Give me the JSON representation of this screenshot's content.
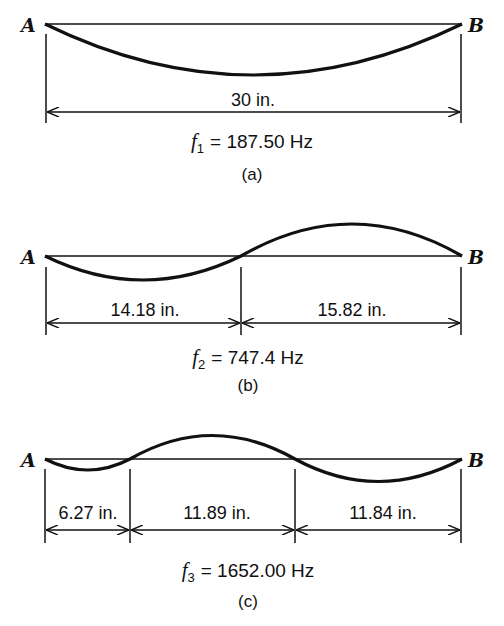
{
  "figure": {
    "panels": [
      {
        "id": "a",
        "caption": "(a)",
        "left_label": "A",
        "right_label": "B",
        "mode": 1,
        "frequency_symbol": "f",
        "frequency_subscript": "1",
        "frequency_value": "= 187.50 Hz",
        "segments": [
          {
            "label": "30 in."
          }
        ]
      },
      {
        "id": "b",
        "caption": "(b)",
        "left_label": "A",
        "right_label": "B",
        "mode": 2,
        "frequency_symbol": "f",
        "frequency_subscript": "2",
        "frequency_value": "= 747.4 Hz",
        "segments": [
          {
            "label": "14.18 in."
          },
          {
            "label": "15.82 in."
          }
        ]
      },
      {
        "id": "c",
        "caption": "(c)",
        "left_label": "A",
        "right_label": "B",
        "mode": 3,
        "frequency_symbol": "f",
        "frequency_subscript": "3",
        "frequency_value": "= 1652.00 Hz",
        "segments": [
          {
            "label": "6.27 in."
          },
          {
            "label": "11.89 in."
          },
          {
            "label": "11.84 in."
          }
        ]
      }
    ]
  }
}
